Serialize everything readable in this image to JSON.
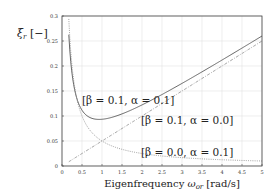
{
  "chart_data": {
    "type": "line",
    "title": "",
    "xlabel": "Eigenfrequency ωor [rad/s]",
    "xlabel_parts": {
      "prefix": "Eigenfrequency ",
      "symbol": "ω",
      "sub": "or",
      "suffix": " [rad/s]"
    },
    "ylabel": "ξr [−]",
    "ylabel_parts": {
      "symbol": "ξ",
      "sub": "r",
      "suffix": " [−]"
    },
    "xlim": [
      0,
      5
    ],
    "ylim": [
      0,
      0.3
    ],
    "xticks": [
      "0",
      "0.5",
      "1",
      "1.5",
      "2",
      "2.5",
      "3",
      "3.5",
      "4",
      "4.5",
      "5"
    ],
    "yticks": [
      "0",
      "0.05",
      "0.1",
      "0.15",
      "0.2",
      "0.25",
      "0.3"
    ],
    "grid": true,
    "legend": "none (inline annotations)",
    "x": [
      0.17,
      0.25,
      0.35,
      0.5,
      0.75,
      1.0,
      1.5,
      2.0,
      2.5,
      3.0,
      3.5,
      4.0,
      4.5,
      5.0
    ],
    "series": [
      {
        "name": "[β = 0.1, α = 0.1]",
        "style": "solid",
        "values": [
          0.2626,
          0.2125,
          0.1604,
          0.125,
          0.1042,
          0.1,
          0.1083,
          0.125,
          0.145,
          0.1667,
          0.1893,
          0.2125,
          0.2361,
          0.26
        ]
      },
      {
        "name": "[β = 0.1, α = 0.0]",
        "style": "dashdot",
        "values": [
          0.0085,
          0.0125,
          0.0175,
          0.025,
          0.0375,
          0.05,
          0.075,
          0.1,
          0.125,
          0.15,
          0.175,
          0.2,
          0.225,
          0.25
        ]
      },
      {
        "name": "[β = 0.0, α = 0.1]",
        "style": "dotted",
        "values": [
          0.2941,
          0.2,
          0.1429,
          0.1,
          0.0667,
          0.05,
          0.0333,
          0.025,
          0.02,
          0.0167,
          0.0143,
          0.0125,
          0.0111,
          0.01
        ]
      }
    ],
    "annotations": [
      {
        "text": "[β = 0.1, α = 0.1]",
        "x": 0.5,
        "y": 0.127
      },
      {
        "text": "[β = 0.1, α = 0.0]",
        "x": 2.0,
        "y": 0.085
      },
      {
        "text": "[β = 0.0, α = 0.1]",
        "x": 2.0,
        "y": 0.022
      }
    ]
  },
  "annotation_labels": {
    "a1": "[β = 0.1, α = 0.1]",
    "a2": "[β = 0.1, α = 0.0]",
    "a3": "[β = 0.0, α = 0.1]"
  }
}
